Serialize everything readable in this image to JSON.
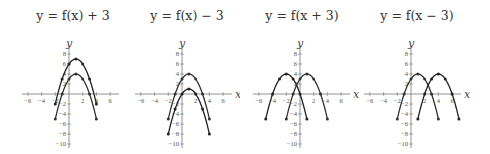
{
  "chart_data": [
    {
      "type": "line",
      "title": "y = f(x) + 3",
      "xlabel": "x",
      "ylabel": "y",
      "xlim": [
        -7,
        7
      ],
      "ylim": [
        -11,
        9
      ],
      "xticks": [
        -6,
        -4,
        -2,
        2,
        4,
        6
      ],
      "yticks": [
        -10,
        -8,
        -6,
        -4,
        -2,
        2,
        4,
        6,
        8
      ],
      "series": [
        {
          "name": "f(x)",
          "color": "#333333",
          "x": [
            -2,
            -1,
            0,
            1,
            2,
            3,
            4
          ],
          "y": [
            -5,
            0,
            3,
            4,
            3,
            0,
            -5
          ]
        },
        {
          "name": "f(x)+3",
          "color": "#222222",
          "x": [
            -2,
            -1,
            0,
            1,
            2,
            3,
            4
          ],
          "y": [
            -2,
            3,
            6,
            7,
            6,
            3,
            -2
          ]
        }
      ]
    },
    {
      "type": "line",
      "title": "y = f(x) − 3",
      "xlabel": "x",
      "ylabel": "y",
      "xlim": [
        -7,
        7
      ],
      "ylim": [
        -11,
        9
      ],
      "xticks": [
        -6,
        -4,
        -2,
        2,
        4,
        6
      ],
      "yticks": [
        -10,
        -8,
        -6,
        -4,
        -2,
        2,
        4,
        6,
        8
      ],
      "series": [
        {
          "name": "f(x)",
          "color": "#333333",
          "x": [
            -2,
            -1,
            0,
            1,
            2,
            3,
            4
          ],
          "y": [
            -5,
            0,
            3,
            4,
            3,
            0,
            -5
          ]
        },
        {
          "name": "f(x)-3",
          "color": "#222222",
          "x": [
            -2,
            -1,
            0,
            1,
            2,
            3,
            4
          ],
          "y": [
            -8,
            -3,
            0,
            1,
            0,
            -3,
            -8
          ]
        }
      ]
    },
    {
      "type": "line",
      "title": "y = f(x + 3)",
      "xlabel": "x",
      "ylabel": "y",
      "xlim": [
        -7,
        7
      ],
      "ylim": [
        -11,
        9
      ],
      "xticks": [
        -6,
        -4,
        -2,
        2,
        4,
        6
      ],
      "yticks": [
        -10,
        -8,
        -6,
        -4,
        -2,
        2,
        4,
        6,
        8
      ],
      "series": [
        {
          "name": "f(x)",
          "color": "#333333",
          "x": [
            -2,
            -1,
            0,
            1,
            2,
            3,
            4
          ],
          "y": [
            -5,
            0,
            3,
            4,
            3,
            0,
            -5
          ]
        },
        {
          "name": "f(x+3)",
          "color": "#222222",
          "x": [
            -5,
            -4,
            -3,
            -2,
            -1,
            0,
            1
          ],
          "y": [
            -5,
            0,
            3,
            4,
            3,
            0,
            -5
          ]
        }
      ]
    },
    {
      "type": "line",
      "title": "y = f(x − 3)",
      "xlabel": "x",
      "ylabel": "y",
      "xlim": [
        -7,
        7
      ],
      "ylim": [
        -11,
        9
      ],
      "xticks": [
        -6,
        -4,
        -2,
        2,
        4,
        6
      ],
      "yticks": [
        -10,
        -8,
        -6,
        -4,
        -2,
        2,
        4,
        6,
        8
      ],
      "series": [
        {
          "name": "f(x)",
          "color": "#333333",
          "x": [
            -2,
            -1,
            0,
            1,
            2,
            3,
            4
          ],
          "y": [
            -5,
            0,
            3,
            4,
            3,
            0,
            -5
          ]
        },
        {
          "name": "f(x-3)",
          "color": "#222222",
          "x": [
            1,
            2,
            3,
            4,
            5,
            6,
            7
          ],
          "y": [
            -5,
            0,
            3,
            4,
            3,
            0,
            -5
          ]
        }
      ]
    }
  ]
}
